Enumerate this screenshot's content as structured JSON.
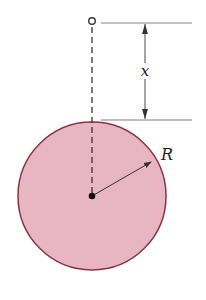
{
  "diagram": {
    "labels": {
      "distance": "x",
      "radius": "R"
    },
    "colors": {
      "sphere_fill": "#e8b6c2",
      "sphere_stroke": "#8a3344",
      "line": "#333333",
      "dim_line": "#666666"
    },
    "elements": {
      "point_mass": "small hollow circle above sphere",
      "sphere": "solid shaded circle of radius R",
      "center": "filled dot at sphere center",
      "axis": "dashed vertical line from point to center"
    }
  }
}
